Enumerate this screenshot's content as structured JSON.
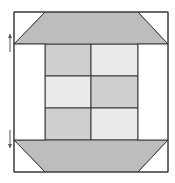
{
  "diagram": {
    "type": "quilt-block",
    "colors": {
      "background": "#ffffff",
      "outline": "#3a3a3a",
      "trapezoid": "#bdbdbd",
      "medium_gray": "#cfcfcf",
      "light_gray": "#ebebeb"
    },
    "outer_square": {
      "x": 14,
      "y": 12,
      "w": 154,
      "h": 160
    },
    "top_trapezoid": {
      "points": "45,12 138,12 168,44 14,44",
      "fill": "trapezoid"
    },
    "bottom_trapezoid": {
      "points": "14,140 168,140 138,172 45,172",
      "fill": "trapezoid"
    },
    "corner_triangles": [
      {
        "name": "top-left",
        "points": "14,12 45,12 14,44"
      },
      {
        "name": "top-right",
        "points": "138,12 168,12 168,44"
      },
      {
        "name": "bottom-left",
        "points": "14,140 14,172 45,172"
      },
      {
        "name": "bottom-right",
        "points": "168,140 168,172 138,172"
      }
    ],
    "grid": {
      "x": [
        45,
        91,
        138
      ],
      "y": [
        44,
        76,
        108,
        140
      ],
      "cells": [
        [
          "medium_gray",
          "light_gray"
        ],
        [
          "light_gray",
          "medium_gray"
        ],
        [
          "medium_gray",
          "light_gray"
        ]
      ]
    },
    "side_strips": [
      {
        "name": "left",
        "x": 14,
        "y": 44,
        "w": 31,
        "h": 96
      },
      {
        "name": "right",
        "x": 138,
        "y": 44,
        "w": 30,
        "h": 96
      }
    ],
    "arrows": [
      {
        "name": "up-arrow",
        "x": 10,
        "y1": 52,
        "y2": 34,
        "direction": "up"
      },
      {
        "name": "down-arrow",
        "x": 10,
        "y1": 130,
        "y2": 148,
        "direction": "down"
      }
    ]
  }
}
